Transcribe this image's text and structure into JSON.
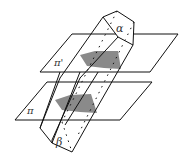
{
  "diagram": {
    "type": "geometry-prism-between-parallel-planes",
    "labels": {
      "top_face": "α",
      "bottom_face": "β",
      "upper_plane": "π'",
      "lower_plane": "π"
    },
    "colors": {
      "line": "#111111",
      "section_fill": "#8a8a8a",
      "background": "#ffffff"
    }
  }
}
